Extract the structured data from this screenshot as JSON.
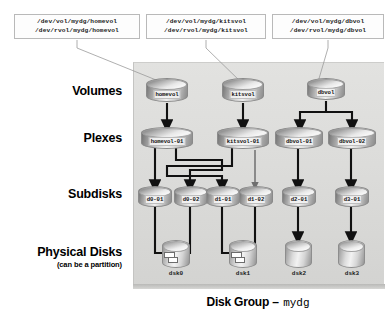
{
  "figure": {
    "caption_prefix": "Disk Group –",
    "caption_name": "mydg"
  },
  "device_paths": [
    {
      "id": "homevol",
      "block": "/dev/vol/mydg/homevol",
      "raw": "/dev/rvol/mydg/homevol"
    },
    {
      "id": "kitsvol",
      "block": "/dev/vol/mydg/kitsvol",
      "raw": "/dev/rvol/mydg/kitsvol"
    },
    {
      "id": "dbvol",
      "block": "/dev/vol/mydg/dbvol",
      "raw": "/dev/rvol/mydg/dbvol"
    }
  ],
  "row_labels": [
    {
      "title": "Volumes",
      "sub": ""
    },
    {
      "title": "Plexes",
      "sub": ""
    },
    {
      "title": "Subdisks",
      "sub": ""
    },
    {
      "title": "Physical Disks",
      "sub": "(can be a partition)"
    }
  ],
  "volumes": [
    {
      "label": "homevol"
    },
    {
      "label": "kitsvol"
    },
    {
      "label": "dbvol"
    }
  ],
  "plexes": [
    {
      "label": "homevol-01"
    },
    {
      "label": "kitsvol-01"
    },
    {
      "label": "dbvol-01"
    },
    {
      "label": "dbvol-02"
    }
  ],
  "subdisks": [
    {
      "label": "d0-01"
    },
    {
      "label": "d0-02"
    },
    {
      "label": "d1-01"
    },
    {
      "label": "d1-02"
    },
    {
      "label": "d2-01"
    },
    {
      "label": "d3-01"
    }
  ],
  "physical_disks": [
    {
      "label": "dsk0"
    },
    {
      "label": "dsk1"
    },
    {
      "label": "dsk2"
    },
    {
      "label": "dsk3"
    }
  ],
  "colors": {
    "panel_bg": "#dcdcda",
    "wire": "#111111",
    "thin_wire": "#6f6f6f",
    "box_border": "#b9b9b9",
    "text": "#000000"
  }
}
